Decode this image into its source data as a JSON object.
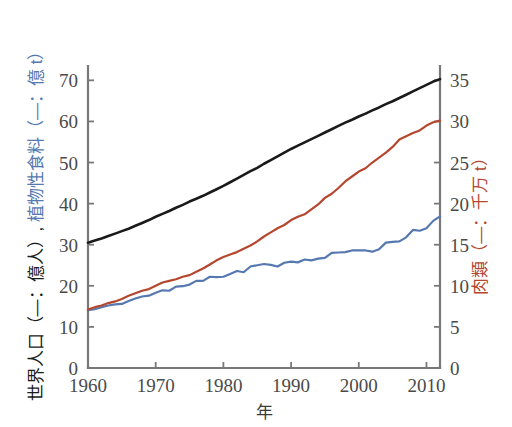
{
  "chart_data": {
    "type": "line",
    "title": "",
    "xlabel": "年",
    "ylabel_left": "世界人口（—：億人）, 植物性食料（—：億 t）",
    "ylabel_right": "肉類（—：千万 t）",
    "xlim": [
      1960,
      2012
    ],
    "ylim_left": [
      0,
      73
    ],
    "ylim_right": [
      0,
      36.5
    ],
    "xticks": [
      1960,
      1970,
      1980,
      1990,
      2000,
      2010
    ],
    "xticklabels": [
      "1960",
      "1970",
      "1980",
      "1990",
      "2000",
      "2010"
    ],
    "yticks_left": [
      0,
      10,
      20,
      30,
      40,
      50,
      60,
      70
    ],
    "yticklabels_left": [
      "0",
      "10",
      "20",
      "30",
      "40",
      "50",
      "60",
      "70"
    ],
    "yticks_right": [
      0,
      5,
      10,
      15,
      20,
      25,
      30,
      35
    ],
    "yticklabels_right": [
      "0",
      "5",
      "10",
      "15",
      "20",
      "25",
      "30",
      "35"
    ],
    "grid": false,
    "legend": "none",
    "x": [
      1960,
      1961,
      1962,
      1963,
      1964,
      1965,
      1966,
      1967,
      1968,
      1969,
      1970,
      1971,
      1972,
      1973,
      1974,
      1975,
      1976,
      1977,
      1978,
      1979,
      1980,
      1981,
      1982,
      1983,
      1984,
      1985,
      1986,
      1987,
      1988,
      1989,
      1990,
      1991,
      1992,
      1993,
      1994,
      1995,
      1996,
      1997,
      1998,
      1999,
      2000,
      2001,
      2002,
      2003,
      2004,
      2005,
      2006,
      2007,
      2008,
      2009,
      2010,
      2011,
      2012
    ],
    "series": [
      {
        "name": "世界人口",
        "axis": "left",
        "unit": "億人",
        "color": "#1a1a1a",
        "values": [
          30.5,
          31.0,
          31.5,
          32.1,
          32.7,
          33.3,
          33.9,
          34.6,
          35.3,
          36.0,
          36.8,
          37.5,
          38.2,
          39.0,
          39.7,
          40.5,
          41.2,
          41.9,
          42.7,
          43.5,
          44.3,
          45.2,
          46.1,
          47.0,
          47.9,
          48.7,
          49.7,
          50.6,
          51.5,
          52.4,
          53.3,
          54.1,
          54.9,
          55.7,
          56.5,
          57.3,
          58.1,
          58.9,
          59.7,
          60.4,
          61.2,
          61.9,
          62.7,
          63.4,
          64.2,
          64.9,
          65.7,
          66.5,
          67.3,
          68.1,
          68.9,
          69.7,
          70.3
        ]
      },
      {
        "name": "植物性食料",
        "axis": "left",
        "unit": "億 t",
        "color": "#5578b0",
        "values": [
          14.1,
          14.3,
          14.8,
          15.2,
          15.5,
          15.6,
          16.3,
          16.9,
          17.4,
          17.6,
          18.3,
          18.9,
          18.8,
          19.8,
          19.9,
          20.3,
          21.2,
          21.2,
          22.2,
          22.1,
          22.2,
          22.9,
          23.6,
          23.3,
          24.7,
          25.0,
          25.3,
          25.1,
          24.7,
          25.6,
          25.9,
          25.7,
          26.4,
          26.2,
          26.6,
          26.8,
          28.0,
          28.1,
          28.2,
          28.6,
          28.6,
          28.6,
          28.3,
          28.9,
          30.5,
          30.7,
          30.8,
          31.8,
          33.6,
          33.4,
          34.0,
          35.8,
          36.9
        ]
      },
      {
        "name": "肉類",
        "axis": "right",
        "unit": "千万 t",
        "color": "#b5472f",
        "values": [
          7.1,
          7.4,
          7.6,
          7.9,
          8.1,
          8.4,
          8.8,
          9.1,
          9.4,
          9.6,
          10.0,
          10.4,
          10.6,
          10.8,
          11.1,
          11.3,
          11.7,
          12.1,
          12.6,
          13.1,
          13.5,
          13.8,
          14.1,
          14.5,
          14.9,
          15.4,
          16.0,
          16.5,
          17.0,
          17.4,
          18.0,
          18.4,
          18.7,
          19.3,
          19.9,
          20.7,
          21.2,
          21.9,
          22.7,
          23.3,
          23.9,
          24.3,
          25.0,
          25.6,
          26.2,
          26.9,
          27.8,
          28.2,
          28.6,
          28.9,
          29.5,
          29.9,
          30.1
        ]
      }
    ]
  }
}
